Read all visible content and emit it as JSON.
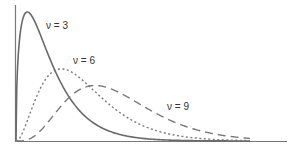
{
  "chart_data": {
    "type": "line",
    "title": "",
    "xlabel": "",
    "ylabel": "",
    "xlim": [
      0,
      24
    ],
    "ylim": [
      0,
      0.26
    ],
    "grid": false,
    "legend": "inline labels",
    "series": [
      {
        "name": "ν = 3",
        "nu": 3,
        "style": "solid",
        "color": "#555555",
        "x": [
          0,
          0.5,
          1,
          2,
          3,
          4,
          5,
          6,
          8,
          10,
          12,
          15,
          18,
          20.7
        ],
        "values": [
          0,
          0.2197,
          0.242,
          0.2076,
          0.1542,
          0.108,
          0.0733,
          0.0487,
          0.0206,
          0.0085,
          0.0034,
          0.0008,
          0.0002,
          0.0001
        ]
      },
      {
        "name": "ν = 6",
        "nu": 6,
        "style": "dotted",
        "color": "#666666",
        "x": [
          0,
          1,
          2,
          3,
          4,
          5,
          6,
          8,
          10,
          12,
          15,
          18,
          20.7
        ],
        "values": [
          0,
          0.0758,
          0.1226,
          0.1255,
          0.1353,
          0.1283,
          0.112,
          0.0733,
          0.0421,
          0.0223,
          0.0079,
          0.0025,
          0.0008
        ]
      },
      {
        "name": "ν = 9",
        "nu": 9,
        "style": "dashed",
        "color": "#777777",
        "x": [
          0,
          2,
          4,
          6,
          7,
          8,
          10,
          12,
          15,
          18,
          20.7
        ],
        "values": [
          0,
          0.0209,
          0.0702,
          0.0977,
          0.1016,
          0.0989,
          0.0836,
          0.0626,
          0.0353,
          0.0172,
          0.0083
        ]
      }
    ],
    "annotations": [
      "ν = 3",
      "ν = 6",
      "ν = 9"
    ]
  },
  "labels": {
    "nu3": "ν = 3",
    "nu6": "ν = 6",
    "nu9": "ν = 9"
  }
}
